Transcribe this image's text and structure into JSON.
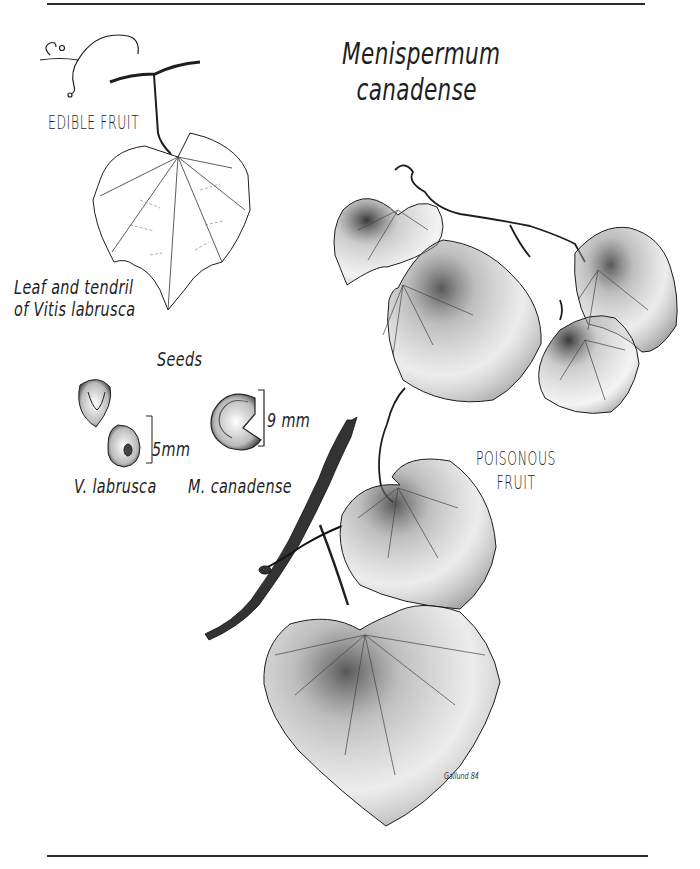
{
  "figure": {
    "title_line1": "Menispermum",
    "title_line2": "canadense",
    "edible_label": "EDIBLE FRUIT",
    "poisonous_label_line1": "POISONOUS",
    "poisonous_label_line2": "FRUIT",
    "leaf_caption_line1": "Leaf and tendril",
    "leaf_caption_line2": "of Vitis labrusca",
    "seeds_heading": "Seeds",
    "seed_left_label": "V. labrusca",
    "seed_right_label": "M. canadense",
    "seed_left_scale": "5mm",
    "seed_right_scale": "9 mm",
    "signature": "Gallund 84",
    "icons": [
      "grape-leaf-icon",
      "tendril-icon",
      "moonseed-leaf-icon",
      "seed-icon",
      "crescent-seed-icon",
      "twig-icon"
    ],
    "colors": {
      "ink": "#1a1a1a",
      "paper": "#ffffff",
      "rule": "#2a2a2a"
    }
  }
}
